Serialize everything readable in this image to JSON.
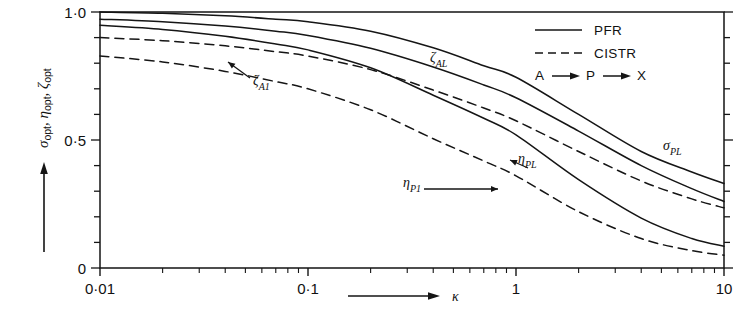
{
  "chart_data": {
    "type": "line",
    "title": "",
    "xlabel": "κ",
    "ylabel": "σ_opt, η_opt, ζ_opt",
    "xscale": "log",
    "xlim": [
      0.01,
      10
    ],
    "ylim": [
      0,
      1.0
    ],
    "xticks": [
      0.01,
      0.1,
      1,
      10
    ],
    "xticklabels": [
      "0·01",
      "0·1",
      "1",
      "10"
    ],
    "yticks": [
      0,
      0.5,
      1.0
    ],
    "yticklabels": [
      "0",
      "0·5",
      "1·0"
    ],
    "yminor_step": 0.1,
    "grid": false,
    "legend_position": "top-right",
    "series": [
      {
        "name": "ζ_AL",
        "label": "ζ",
        "sublabel": "AL",
        "style": "solid",
        "reactor": "PFR",
        "x": [
          0.01,
          0.02,
          0.04,
          0.07,
          0.1,
          0.2,
          0.4,
          0.7,
          1,
          2,
          4,
          7,
          10
        ],
        "y": [
          1.0,
          0.995,
          0.985,
          0.972,
          0.962,
          0.925,
          0.86,
          0.79,
          0.745,
          0.6,
          0.455,
          0.375,
          0.33
        ]
      },
      {
        "name": "ζ_A1",
        "label": "ζ",
        "sublabel": "A1",
        "style": "dashed",
        "reactor": "CISTR",
        "x": [
          0.01,
          0.02,
          0.04,
          0.07,
          0.1,
          0.2,
          0.4,
          0.7,
          1,
          2,
          4,
          7,
          10
        ],
        "y": [
          0.9,
          0.888,
          0.868,
          0.845,
          0.828,
          0.775,
          0.695,
          0.625,
          0.575,
          0.455,
          0.34,
          0.27,
          0.235
        ]
      },
      {
        "name": "σ_PL",
        "label": "σ",
        "sublabel": "PL",
        "style": "solid",
        "reactor": "PFR",
        "x": [
          0.01,
          0.02,
          0.04,
          0.07,
          0.1,
          0.2,
          0.4,
          0.7,
          1,
          2,
          4,
          7,
          10
        ],
        "y": [
          0.972,
          0.962,
          0.945,
          0.925,
          0.908,
          0.858,
          0.785,
          0.715,
          0.665,
          0.535,
          0.4,
          0.31,
          0.26
        ]
      },
      {
        "name": "η_PL",
        "label": "η",
        "sublabel": "PL",
        "style": "solid",
        "reactor": "PFR",
        "x": [
          0.01,
          0.02,
          0.04,
          0.07,
          0.1,
          0.2,
          0.4,
          0.7,
          1,
          2,
          4,
          7,
          10
        ],
        "y": [
          0.948,
          0.932,
          0.905,
          0.875,
          0.852,
          0.782,
          0.675,
          0.585,
          0.52,
          0.345,
          0.195,
          0.115,
          0.085
        ]
      },
      {
        "name": "η_P1",
        "label": "η",
        "sublabel": "P1",
        "style": "dashed",
        "reactor": "CISTR",
        "x": [
          0.01,
          0.02,
          0.04,
          0.07,
          0.1,
          0.2,
          0.4,
          0.7,
          1,
          2,
          4,
          7,
          10
        ],
        "y": [
          0.828,
          0.805,
          0.768,
          0.728,
          0.7,
          0.618,
          0.505,
          0.418,
          0.36,
          0.22,
          0.115,
          0.068,
          0.05
        ]
      }
    ],
    "annotations": [
      {
        "name": "zeta-AL-label",
        "text": "ζ",
        "sub": "AL",
        "x_px": 430,
        "y_px": 62,
        "arrow": false
      },
      {
        "name": "zeta-A1-label",
        "text": "ζ",
        "sub": "A1",
        "x_px": 253,
        "y_px": 85,
        "arrow": true
      },
      {
        "name": "sigma-PL-label",
        "text": "σ",
        "sub": "PL",
        "x_px": 663,
        "y_px": 150,
        "arrow": false
      },
      {
        "name": "eta-PL-label",
        "text": "η",
        "sub": "PL",
        "x_px": 518,
        "y_px": 163,
        "arrow": true
      },
      {
        "name": "eta-P1-label",
        "text": "η",
        "sub": "P1",
        "x_px": 403,
        "y_px": 187,
        "arrow": true
      }
    ]
  },
  "legend": {
    "items": [
      {
        "label": "PFR",
        "style": "solid"
      },
      {
        "label": "CISTR",
        "style": "dashed"
      }
    ],
    "scheme": {
      "a": "A",
      "p": "P",
      "x": "X",
      "arrow": "→",
      "full": "A → P → X"
    }
  },
  "axes": {
    "y_title_parts": [
      {
        "sym": "σ",
        "sub": "opt"
      },
      {
        "sym": "η",
        "sub": "opt"
      },
      {
        "sym": "ζ",
        "sub": "opt"
      }
    ],
    "y_title_full": "σopt, ηopt, ζopt",
    "x_title": "κ",
    "x_arrow": "⟶",
    "y_arrow": "↑"
  },
  "colors": {
    "line": "#151515",
    "text": "#111111",
    "background": "#ffffff"
  }
}
